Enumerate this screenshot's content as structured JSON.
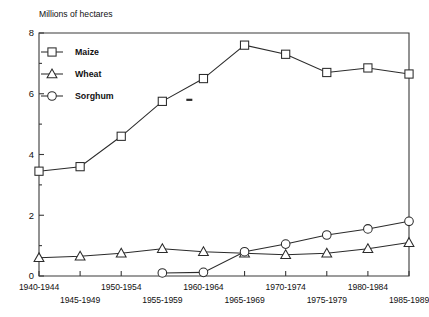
{
  "chart_data": {
    "type": "line",
    "title": "Millions of hectares",
    "xlabel": "",
    "ylabel": "Millions of hectares",
    "ylim": [
      0,
      8
    ],
    "yticks": [
      0,
      2,
      4,
      6,
      8
    ],
    "yminor": [
      1,
      3,
      5,
      7
    ],
    "grid": false,
    "legend_position": "top-left",
    "categories": [
      "1940-1944",
      "1945-1949",
      "1950-1954",
      "1955-1959",
      "1960-1964",
      "1965-1969",
      "1970-1974",
      "1975-1979",
      "1980-1984",
      "1985-1989"
    ],
    "xtick_labels_row1": [
      "1940-1944",
      "1950-1954",
      "1960-1964",
      "1970-1974",
      "1980-1984"
    ],
    "xtick_labels_row2": [
      "1945-1949",
      "1955-1959",
      "1965-1969",
      "1975-1979",
      "1985-1989"
    ],
    "series": [
      {
        "name": "Maize",
        "marker": "square",
        "values": [
          3.45,
          3.6,
          4.6,
          5.75,
          6.5,
          7.6,
          7.3,
          6.7,
          6.85,
          6.65
        ]
      },
      {
        "name": "Wheat",
        "marker": "triangle",
        "values": [
          0.6,
          0.65,
          0.75,
          0.9,
          0.8,
          0.75,
          0.7,
          0.75,
          0.9,
          1.1
        ]
      },
      {
        "name": "Sorghum",
        "marker": "circle",
        "values": [
          null,
          null,
          null,
          0.1,
          0.12,
          0.8,
          1.05,
          1.35,
          1.55,
          1.8
        ]
      }
    ],
    "annotations": [
      {
        "name": "stray-dash-mark",
        "x_category": "1955-1959",
        "y": 5.8
      }
    ],
    "colors": {
      "axis": "#3a3a3a",
      "series": "#2b2b2b",
      "background": "#ffffff"
    }
  },
  "legend": {
    "entries": [
      {
        "label": "Maize",
        "marker": "square"
      },
      {
        "label": "Wheat",
        "marker": "triangle"
      },
      {
        "label": "Sorghum",
        "marker": "circle"
      }
    ]
  }
}
